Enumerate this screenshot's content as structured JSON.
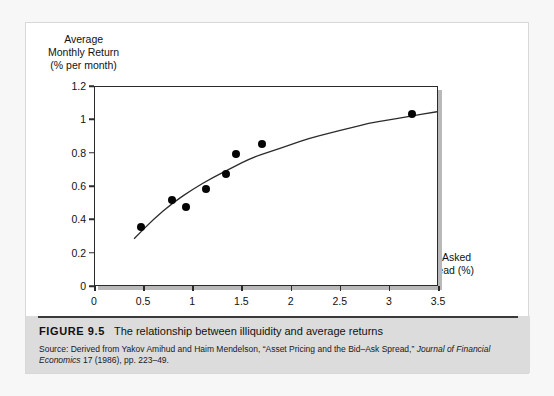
{
  "figure": {
    "number_label": "FIGURE 9.5",
    "title": "The relationship between illiquidity and average returns",
    "source_part1": "Source: Derived from Yakov Amihud and Haim Mendelson, “Asset Pricing and the Bid–Ask Spread,” ",
    "source_italic": "Journal of Financial Economics",
    "source_part2": " 17 (1986), pp. 223–49."
  },
  "chart_data": {
    "type": "scatter",
    "title": "",
    "xlabel": "Bid–Asked\nSpread (%)",
    "ylabel": "Average\nMonthly Return\n(% per month)",
    "xlim": [
      0,
      3.5
    ],
    "ylim": [
      0,
      1.2
    ],
    "xticks": [
      0,
      0.5,
      1,
      1.5,
      2,
      2.5,
      3,
      3.5
    ],
    "xtick_labels": [
      "0",
      "0.5",
      "1",
      "1.5",
      "2",
      "2.5",
      "3",
      "3.5"
    ],
    "yticks": [
      0,
      0.2,
      0.4,
      0.6,
      0.8,
      1,
      1.2
    ],
    "ytick_labels": [
      "0",
      "0.2",
      "0.4",
      "0.6",
      "0.8",
      "1",
      "1.2"
    ],
    "grid": false,
    "legend": "none",
    "points": [
      {
        "x": 0.47,
        "y": 0.36
      },
      {
        "x": 0.78,
        "y": 0.52
      },
      {
        "x": 0.93,
        "y": 0.48
      },
      {
        "x": 1.13,
        "y": 0.59
      },
      {
        "x": 1.33,
        "y": 0.68
      },
      {
        "x": 1.43,
        "y": 0.8
      },
      {
        "x": 1.7,
        "y": 0.86
      },
      {
        "x": 3.23,
        "y": 1.04
      }
    ],
    "fit_curve": {
      "name": "fitted concave curve",
      "points": [
        {
          "x": 0.4,
          "y": 0.28
        },
        {
          "x": 0.6,
          "y": 0.4
        },
        {
          "x": 0.8,
          "y": 0.5
        },
        {
          "x": 1.0,
          "y": 0.58
        },
        {
          "x": 1.2,
          "y": 0.65
        },
        {
          "x": 1.4,
          "y": 0.71
        },
        {
          "x": 1.6,
          "y": 0.77
        },
        {
          "x": 1.8,
          "y": 0.81
        },
        {
          "x": 2.0,
          "y": 0.85
        },
        {
          "x": 2.2,
          "y": 0.89
        },
        {
          "x": 2.4,
          "y": 0.92
        },
        {
          "x": 2.6,
          "y": 0.95
        },
        {
          "x": 2.8,
          "y": 0.98
        },
        {
          "x": 3.0,
          "y": 1.0
        },
        {
          "x": 3.2,
          "y": 1.02
        },
        {
          "x": 3.5,
          "y": 1.05
        }
      ]
    }
  },
  "colors": {
    "dot": "#050505",
    "curve": "#2b2b2b",
    "axis": "#2b2b2b",
    "caption_band": "#dcdcdc",
    "panel": "#ffffff",
    "page": "#f7f7f7"
  }
}
